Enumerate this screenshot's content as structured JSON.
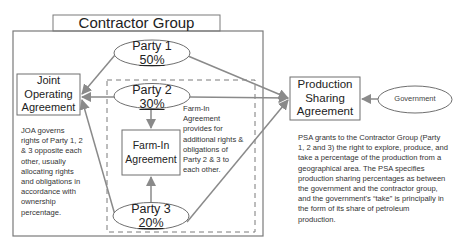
{
  "diagram": {
    "contractor_group": {
      "title": "Contractor Group"
    },
    "parties": [
      {
        "name": "Party 1",
        "share": "50%"
      },
      {
        "name": "Party 2",
        "share": "30%"
      },
      {
        "name": "Party 3",
        "share": "20%"
      }
    ],
    "joa": {
      "label_lines": [
        "Joint",
        "Operating",
        "Agreement"
      ],
      "description": "JOA governs rights of Party 1, 2 & 3 opposite each other, usually allocating rights and obligations in accordance with ownership percentage."
    },
    "farm_in": {
      "label_lines": [
        "Farm-In",
        "Agreement"
      ],
      "description": "Farm-In Agreement provides for additional rights & obligations of Party 2 & 3 to each other."
    },
    "psa": {
      "label_lines": [
        "Production",
        "Sharing",
        "Agreement"
      ],
      "description": "PSA grants to the Contractor Group (Party 1, 2 and 3) the right to explore, produce, and take a percentage of the production from a geographical area. The PSA specifies production sharing percentages as between the government and the contractor group, and the government's “take” is principally in the form of its share of petroleum production."
    },
    "government": {
      "label": "Government"
    },
    "colors": {
      "line": "#8a8a8a",
      "box_border": "#6f6f6f",
      "text": "#222222"
    }
  }
}
